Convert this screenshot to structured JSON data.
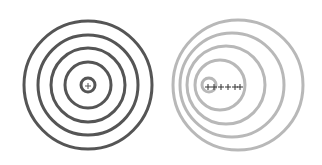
{
  "diagram": {
    "type": "wavefront-comparison",
    "panels": [
      {
        "name": "stationary-source",
        "stroke": "#555555",
        "stroke_width": 3,
        "circles": [
          {
            "cx": 88,
            "cy": 85,
            "r": 64
          },
          {
            "cx": 88,
            "cy": 85,
            "r": 50
          },
          {
            "cx": 88,
            "cy": 85,
            "r": 37
          },
          {
            "cx": 88,
            "cy": 85,
            "r": 23
          },
          {
            "cx": 88,
            "cy": 85,
            "r": 7
          }
        ],
        "markers": [
          {
            "x": 88,
            "y": 86
          }
        ]
      },
      {
        "name": "moving-source",
        "stroke": "#b8b8b8",
        "stroke_width": 3,
        "circles": [
          {
            "cx": 238,
            "cy": 85,
            "r": 65
          },
          {
            "cx": 232,
            "cy": 85,
            "r": 52
          },
          {
            "cx": 226,
            "cy": 85,
            "r": 39
          },
          {
            "cx": 220,
            "cy": 85,
            "r": 25
          },
          {
            "cx": 209,
            "cy": 85,
            "r": 7
          }
        ],
        "markers": [
          {
            "x": 208,
            "y": 87
          },
          {
            "x": 214,
            "y": 87
          },
          {
            "x": 221,
            "y": 87
          },
          {
            "x": 228,
            "y": 87
          },
          {
            "x": 235,
            "y": 87
          },
          {
            "x": 240,
            "y": 87
          }
        ],
        "marker_color": "#333333"
      }
    ]
  }
}
